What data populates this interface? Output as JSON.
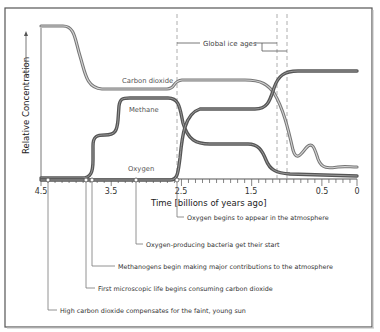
{
  "chart_data": {
    "type": "line",
    "title": "",
    "xlabel": "Time [billions of years ago]",
    "ylabel": "Relative Concentration",
    "x_ticks": [
      "4.5",
      "3.5",
      "2.5",
      "1.5",
      "0.5",
      "0"
    ],
    "xlim": [
      4.5,
      0
    ],
    "ylim": [
      0,
      1
    ],
    "grid": false,
    "legend": "inline labels",
    "series": [
      {
        "name": "Carbon dioxide",
        "color": "#8a8a8a",
        "x": [
          4.5,
          4.2,
          4.0,
          3.8,
          3.5,
          3.0,
          2.4,
          2.3,
          2.2,
          1.5,
          1.0,
          0.75,
          0.55,
          0.45,
          0.3,
          0.2,
          0.1,
          0.0
        ],
        "values": [
          1.0,
          1.0,
          0.82,
          0.66,
          0.65,
          0.65,
          0.65,
          0.68,
          0.69,
          0.69,
          0.68,
          0.6,
          0.35,
          0.2,
          0.24,
          0.19,
          0.12,
          0.11
        ]
      },
      {
        "name": "Methane",
        "color": "#4a4a4a",
        "x": [
          4.5,
          3.8,
          3.7,
          3.5,
          3.3,
          3.2,
          2.5,
          2.3,
          2.1,
          1.5,
          1.0,
          0.8,
          0.6,
          0.3,
          0.0
        ],
        "values": [
          0.0,
          0.02,
          0.28,
          0.3,
          0.36,
          0.57,
          0.57,
          0.5,
          0.28,
          0.25,
          0.24,
          0.12,
          0.03,
          0.01,
          0.0
        ]
      },
      {
        "name": "Oxygen",
        "color": "#4a4a4a",
        "x": [
          4.5,
          3.0,
          2.3,
          2.2,
          2.1,
          2.0,
          1.5,
          1.0,
          0.8,
          0.65,
          0.5,
          0.0
        ],
        "values": [
          0.0,
          0.0,
          0.0,
          0.15,
          0.38,
          0.42,
          0.42,
          0.43,
          0.55,
          0.7,
          0.72,
          0.72
        ]
      }
    ],
    "vertical_markers": [
      2.3,
      0.85,
      0.6
    ],
    "annotations": [
      {
        "x": 4.4,
        "text": "High carbon dioxide compensates for the faint, young sun"
      },
      {
        "x": 3.8,
        "text": "First microscopic life begins consuming carbon dioxide"
      },
      {
        "x": 3.7,
        "text": "Methanogens begin making major contributions to the atmosphere"
      },
      {
        "x": 3.1,
        "text": "Oxygen-producing bacteria get their start"
      },
      {
        "x": 2.3,
        "text": "Oxygen begins to appear in the atmosphere"
      }
    ],
    "bracket_label": "Global ice ages"
  },
  "labels": {
    "ylabel": "Relative Concentration",
    "xlabel": "Time [billions of years ago]",
    "ice_ages": "Global ice ages",
    "co2": "Carbon dioxide",
    "methane": "Methane",
    "oxygen": "Oxygen",
    "ticks": [
      "4.5",
      "3.5",
      "2.5",
      "1.5",
      "0.5",
      "0"
    ],
    "annotations": [
      "Oxygen begins to appear in the atmosphere",
      "Oxygen-producing bacteria get their start",
      "Methanogens begin making major contributions to the atmosphere",
      "First microscopic life begins consuming carbon dioxide",
      "High carbon dioxide compensates for the faint, young sun"
    ]
  }
}
